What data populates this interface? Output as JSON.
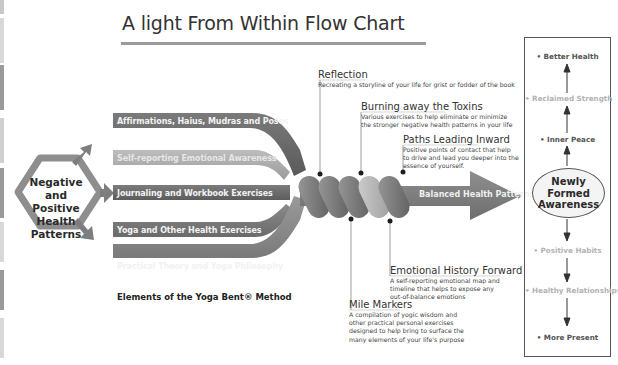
{
  "title": "A light From Within Flow Chart",
  "source_node": {
    "label": "Negative and Positive Health Patterns",
    "lines": [
      "Negative",
      "and Positive",
      "Health",
      "Patterns"
    ]
  },
  "elements": {
    "caption": "Elements of the Yoga Bent® Method",
    "ribbons": [
      {
        "label": "Affirmations, Haius, Mudras and Poses",
        "color": "#6b6b6b"
      },
      {
        "label": "Self-reporting Emotional Awareness",
        "color": "#a9a9a9"
      },
      {
        "label": "Journaling and Workbook Exercises",
        "color": "#6e6e6e"
      },
      {
        "label": "Yoga and Other Health Exercises",
        "color": "#7d7d7d"
      },
      {
        "label": "Practical Theory and Yoga Philosophy",
        "color": "#8c8c8c"
      }
    ]
  },
  "annotations": [
    {
      "id": "reflection",
      "heading": "Reflection",
      "body": [
        "Recreating a storyline of your life for grist or fodder of the book"
      ]
    },
    {
      "id": "burning-away-the-toxins",
      "heading": "Burning away the Toxins",
      "body": [
        "Various exercises to help eliminate or minimize",
        "the stronger negative health patterns in your life"
      ]
    },
    {
      "id": "paths-leading-inward",
      "heading": "Paths Leading Inward",
      "body": [
        "Positive points of contact that help",
        "to drive and lead you deeper into the",
        "essence of yourself."
      ]
    },
    {
      "id": "emotional-history-forward",
      "heading": "Emotional History Forward",
      "body": [
        "A self-reporting emotional map and",
        "timeline that helps to expose any",
        "out-of-balance emotions"
      ]
    },
    {
      "id": "mile-markers",
      "heading": "Mile Markers",
      "body": [
        "A compilation of yogic wisdom and",
        "other practical personal exercises",
        "designed to help bring to surface the",
        "many elements of your life's purpose"
      ]
    }
  ],
  "output_arrow": {
    "label": "Balanced Health Patterns"
  },
  "outcomes": {
    "center": {
      "label": "Newly Formed Awareness",
      "lines": [
        "Newly",
        "Formed",
        "Awareness"
      ]
    },
    "upward": [
      {
        "label": "• Better Health",
        "tone": "dark"
      },
      {
        "label": "• Reclaimed Strength",
        "tone": "light"
      },
      {
        "label": "• Inner Peace",
        "tone": "dark"
      }
    ],
    "downward": [
      {
        "label": "• Positive Habits",
        "tone": "light"
      },
      {
        "label": "• Healthy Relationships",
        "tone": "light"
      },
      {
        "label": "• More Present",
        "tone": "dark"
      }
    ]
  },
  "colors": {
    "dark_gray": "#6b6b6b",
    "mid_gray": "#8c8c8c",
    "light_gray": "#b0b0b0",
    "border": "#555555"
  }
}
